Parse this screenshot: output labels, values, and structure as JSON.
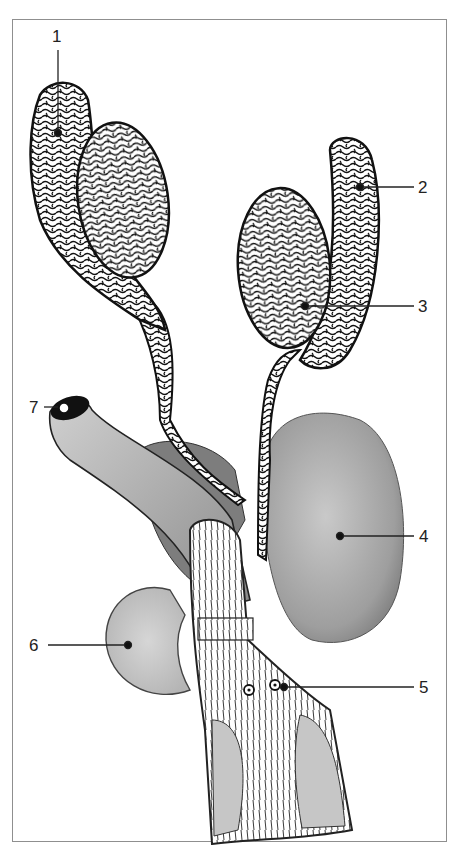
{
  "figure": {
    "type": "anatomical-illustration",
    "frame_color": "#8f8f8f",
    "ink_color": "#111111",
    "shade_color": "#9a9a9a",
    "labels": [
      {
        "id": "1",
        "text": "1",
        "x": 56,
        "y": 42,
        "side": "top"
      },
      {
        "id": "2",
        "text": "2",
        "x": 421,
        "y": 187,
        "side": "right"
      },
      {
        "id": "3",
        "text": "3",
        "x": 421,
        "y": 306,
        "side": "right"
      },
      {
        "id": "4",
        "text": "4",
        "x": 422,
        "y": 536,
        "side": "right"
      },
      {
        "id": "5",
        "text": "5",
        "x": 422,
        "y": 687,
        "side": "right"
      },
      {
        "id": "6",
        "text": "6",
        "x": 29,
        "y": 645,
        "side": "left"
      },
      {
        "id": "7",
        "text": "7",
        "x": 29,
        "y": 407,
        "side": "left"
      }
    ]
  }
}
